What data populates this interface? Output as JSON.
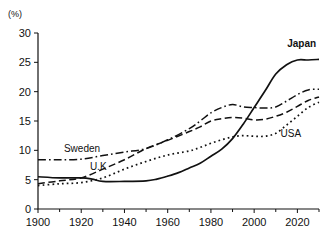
{
  "chart_data": {
    "type": "line",
    "title": "",
    "subtitle": "",
    "xlabel": "",
    "ylabel": "(%)",
    "unit_label": "(%)",
    "xlim": [
      1900,
      2030
    ],
    "ylim": [
      0,
      30
    ],
    "grid": false,
    "legend_position": "inline-annotations",
    "y_ticks": [
      "0",
      "5",
      "10",
      "15",
      "20",
      "25",
      "30"
    ],
    "y_tick_values": [
      0,
      5,
      10,
      15,
      20,
      25,
      30
    ],
    "x_ticks": [
      "1900",
      "1920",
      "1940",
      "1960",
      "1980",
      "2000",
      "2020"
    ],
    "x_tick_values": [
      1900,
      1920,
      1940,
      1960,
      1980,
      2000,
      2020
    ],
    "x_minor_tick_values": [
      1910,
      1930,
      1950,
      1970,
      1990,
      2010,
      2030
    ],
    "series": [
      {
        "name": "Japan",
        "style": "solid",
        "label_bold": true,
        "x": [
          1900,
          1910,
          1920,
          1925,
          1930,
          1940,
          1950,
          1955,
          1960,
          1965,
          1970,
          1975,
          1980,
          1985,
          1990,
          1995,
          2000,
          2005,
          2010,
          2015,
          2020,
          2025,
          2030
        ],
        "values": [
          5.5,
          5.3,
          5.3,
          5.1,
          4.7,
          4.7,
          4.8,
          5.1,
          5.6,
          6.2,
          7.0,
          7.8,
          9.0,
          10.2,
          12.0,
          14.5,
          17.3,
          20.1,
          23.0,
          24.6,
          25.4,
          25.4,
          25.5
        ]
      },
      {
        "name": "Sweden",
        "style": "dash-dot",
        "label_bold": false,
        "x": [
          1900,
          1910,
          1920,
          1930,
          1940,
          1950,
          1960,
          1970,
          1975,
          1980,
          1985,
          1990,
          1995,
          2000,
          2005,
          2010,
          2015,
          2020,
          2025,
          2030
        ],
        "values": [
          8.4,
          8.4,
          8.5,
          9.1,
          9.7,
          10.3,
          11.8,
          13.7,
          15.0,
          16.4,
          17.3,
          17.8,
          17.4,
          17.3,
          17.2,
          17.4,
          18.4,
          19.5,
          20.3,
          20.4
        ]
      },
      {
        "name": "U.K",
        "style": "dashed",
        "label_bold": false,
        "x": [
          1900,
          1910,
          1920,
          1930,
          1940,
          1950,
          1960,
          1970,
          1975,
          1980,
          1985,
          1990,
          1995,
          2000,
          2005,
          2010,
          2015,
          2020,
          2025,
          2030
        ],
        "values": [
          4.3,
          4.8,
          5.3,
          6.8,
          8.4,
          10.3,
          11.7,
          13.2,
          14.0,
          15.0,
          15.4,
          15.6,
          15.5,
          15.2,
          15.3,
          15.8,
          16.5,
          17.5,
          18.5,
          19.1
        ]
      },
      {
        "name": "USA",
        "style": "dotted",
        "label_bold": false,
        "x": [
          1900,
          1910,
          1920,
          1930,
          1940,
          1950,
          1960,
          1970,
          1975,
          1980,
          1985,
          1990,
          1995,
          2000,
          2005,
          2010,
          2015,
          2020,
          2025,
          2030
        ],
        "values": [
          4.0,
          4.3,
          4.5,
          5.3,
          6.8,
          8.1,
          9.2,
          9.9,
          10.5,
          11.2,
          11.8,
          12.3,
          12.5,
          12.4,
          12.4,
          12.9,
          14.3,
          15.8,
          17.3,
          18.2
        ]
      }
    ],
    "annotations": [
      {
        "text": "Japan",
        "x": 2022,
        "y": 27.6,
        "bold": true
      },
      {
        "text": "Sweden",
        "x": 1912,
        "y": 9.7,
        "bold": false
      },
      {
        "text": "U.K",
        "x": 1924,
        "y": 6.6,
        "bold": false
      },
      {
        "text": "USA",
        "x": 2017,
        "y": 12.2,
        "bold": false
      }
    ]
  },
  "colors": {
    "ink": "#111111",
    "background": "#ffffff"
  }
}
